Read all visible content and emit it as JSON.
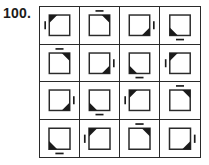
{
  "label": {
    "question_number": "100."
  },
  "puzzle": {
    "type": "abstract-reasoning-matrix",
    "rows": 4,
    "columns": 4,
    "colors": {
      "ink": "#2a2a2a",
      "fill": "#1b1b1b",
      "background": "#ffffff"
    },
    "figure_description": "square with one filled black corner triangle and a short tick mark on one outer side",
    "cells": [
      {
        "row": 1,
        "col": 1,
        "corner": "top-left",
        "tick": "left",
        "name": "cell-r1c1"
      },
      {
        "row": 1,
        "col": 2,
        "corner": "top-right",
        "tick": "top",
        "name": "cell-r1c2"
      },
      {
        "row": 1,
        "col": 3,
        "corner": "bottom-right",
        "tick": "right",
        "name": "cell-r1c3"
      },
      {
        "row": 1,
        "col": 4,
        "corner": "bottom-left",
        "tick": "bottom",
        "name": "cell-r1c4"
      },
      {
        "row": 2,
        "col": 1,
        "corner": "top-right",
        "tick": "top",
        "name": "cell-r2c1"
      },
      {
        "row": 2,
        "col": 2,
        "corner": "bottom-right",
        "tick": "right",
        "name": "cell-r2c2"
      },
      {
        "row": 2,
        "col": 3,
        "corner": "bottom-left",
        "tick": "bottom",
        "name": "cell-r2c3"
      },
      {
        "row": 2,
        "col": 4,
        "corner": "top-left",
        "tick": "left",
        "name": "cell-r2c4"
      },
      {
        "row": 3,
        "col": 1,
        "corner": "bottom-right",
        "tick": "right",
        "name": "cell-r3c1"
      },
      {
        "row": 3,
        "col": 2,
        "corner": "bottom-left",
        "tick": "bottom",
        "name": "cell-r3c2"
      },
      {
        "row": 3,
        "col": 3,
        "corner": "top-left",
        "tick": "left",
        "name": "cell-r3c3"
      },
      {
        "row": 3,
        "col": 4,
        "corner": "top-right",
        "tick": "top",
        "name": "cell-r3c4"
      },
      {
        "row": 4,
        "col": 1,
        "corner": "bottom-left",
        "tick": "bottom",
        "name": "cell-r4c1"
      },
      {
        "row": 4,
        "col": 2,
        "corner": "top-left",
        "tick": "left",
        "name": "cell-r4c2"
      },
      {
        "row": 4,
        "col": 3,
        "corner": "top-right",
        "tick": "top",
        "name": "cell-r4c3"
      },
      {
        "row": 4,
        "col": 4,
        "corner": "bottom-right",
        "tick": "right",
        "name": "cell-r4c4"
      }
    ]
  }
}
